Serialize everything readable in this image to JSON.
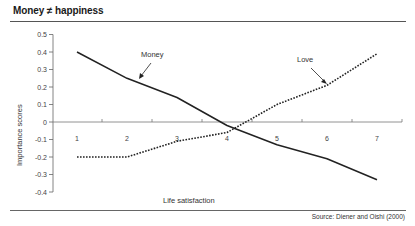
{
  "header": {
    "title": "Money ≠ happiness"
  },
  "footer": {
    "source": "Source: Diener and Oishi (2000)"
  },
  "chart_data": {
    "type": "line",
    "title": "Money ≠ happiness",
    "xlabel": "Life satisfaction",
    "ylabel": "Importance scores",
    "x": [
      1,
      2,
      3,
      4,
      5,
      6,
      7
    ],
    "x_tick_labels": [
      "1",
      "2",
      "3",
      "4",
      "5",
      "6",
      "7"
    ],
    "y_tick_labels": [
      "0.5",
      "0.4",
      "0.3",
      "0.2",
      "0.1",
      "0",
      "-0.1",
      "-0.2",
      "-0.3",
      "-0.4"
    ],
    "ylim": [
      -0.4,
      0.5
    ],
    "grid": false,
    "legend_position": "inline annotations with arrows",
    "series": [
      {
        "name": "Money",
        "style": "solid",
        "color": "#222222",
        "values": [
          0.4,
          0.25,
          0.14,
          -0.02,
          -0.13,
          -0.21,
          -0.33
        ]
      },
      {
        "name": "Love",
        "style": "dotted",
        "color": "#222222",
        "values": [
          -0.2,
          -0.2,
          -0.11,
          -0.06,
          0.1,
          0.21,
          0.39
        ]
      }
    ],
    "annotations": [
      {
        "text": "Money",
        "points_to_series": "Money"
      },
      {
        "text": "Love",
        "points_to_series": "Love"
      }
    ],
    "source": "Source: Diener and Oishi (2000)"
  }
}
